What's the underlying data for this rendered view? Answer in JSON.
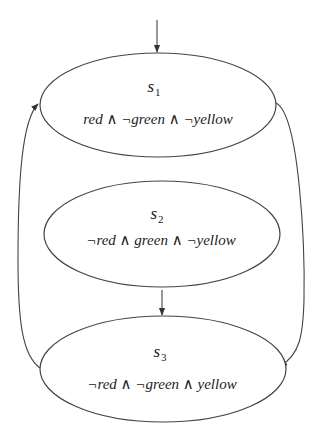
{
  "diagram": {
    "type": "state-transition",
    "colors": {
      "stroke": "#444444",
      "text": "#222222",
      "background": "#ffffff"
    },
    "states": [
      {
        "id": "s1",
        "name": "s",
        "subscript": "1",
        "label": "red ∧ ¬green ∧ ¬yellow",
        "initial": true
      },
      {
        "id": "s2",
        "name": "s",
        "subscript": "2",
        "label": "¬red ∧ green ∧ ¬yellow",
        "initial": false
      },
      {
        "id": "s3",
        "name": "s",
        "subscript": "3",
        "label": "¬red ∧ ¬green ∧ yellow",
        "initial": false
      }
    ],
    "transitions": [
      {
        "from": "start",
        "to": "s1"
      },
      {
        "from": "s1",
        "to": "s3"
      },
      {
        "from": "s2",
        "to": "s3"
      },
      {
        "from": "s3",
        "to": "s1"
      }
    ]
  }
}
